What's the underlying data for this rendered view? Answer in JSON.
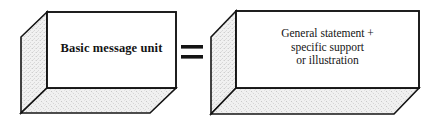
{
  "diagram": {
    "type": "equation-of-3d-boxes",
    "background_color": "#ffffff",
    "stroke_color": "#141414",
    "face_front_color": "#ffffff",
    "face_shaded_color": "#efefef",
    "text_color": "#141414",
    "left_box": {
      "name": "basic-message-unit-box",
      "label": "Basic message unit",
      "label_lines": [
        "Basic message unit"
      ],
      "front_face": {
        "x": 47,
        "y": 12,
        "width": 129,
        "height": 76
      },
      "depth": {
        "dx": -26,
        "dy": 25
      }
    },
    "operator": {
      "name": "equals-sign",
      "symbol": "=",
      "x": 181,
      "y": 44,
      "bar_width": 22,
      "bar_height": 4,
      "bar_gap": 6
    },
    "right_box": {
      "name": "general-statement-box",
      "label": "General statement + specific support or illustration",
      "label_lines": [
        "General statement +",
        "specific support",
        "or illustration"
      ],
      "front_face": {
        "x": 236,
        "y": 11,
        "width": 183,
        "height": 77
      },
      "depth": {
        "dx": -25,
        "dy": 26
      }
    }
  }
}
